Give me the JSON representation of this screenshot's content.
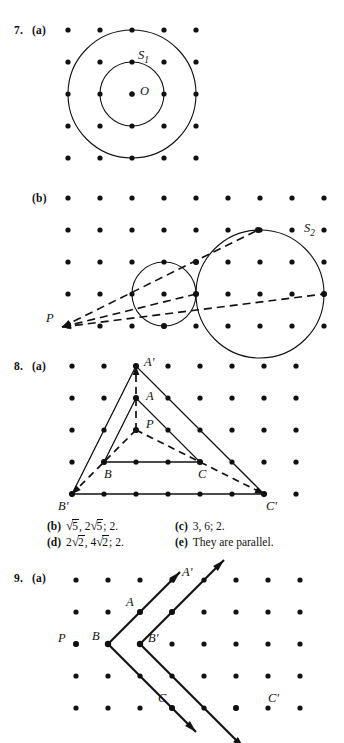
{
  "page": {
    "width": 344,
    "height": 743,
    "background": "#ffffff",
    "ink": "#111111"
  },
  "problems": [
    {
      "id": "problem-7a",
      "number": "7.",
      "part": "(a)",
      "figure": {
        "type": "lattice-circles",
        "lattice": {
          "cols": 5,
          "rows": 5,
          "spacing": 32,
          "origin_x": 68,
          "origin_y": 22,
          "dot_radius": 2.6
        },
        "circles": [
          {
            "name": "inner-circle",
            "label": "S_1",
            "cx": 132,
            "cy": 86,
            "r": 32
          },
          {
            "name": "outer-circle",
            "label": "",
            "cx": 132,
            "cy": 86,
            "r": 64
          }
        ],
        "labels": [
          {
            "name": "label-S1",
            "text": "S",
            "sub": "1",
            "x": 138,
            "y": 51,
            "style": "italic"
          },
          {
            "name": "label-O",
            "text": "O",
            "sub": "",
            "x": 140,
            "y": 87,
            "style": "italic"
          }
        ],
        "center_point": {
          "name": "center-O",
          "x": 132,
          "y": 86
        }
      }
    },
    {
      "id": "problem-7b",
      "number": "",
      "part": "(b)",
      "figure": {
        "type": "lattice-homothety-circles",
        "lattice": {
          "cols": 9,
          "rows": 5,
          "spacing": 32,
          "origin_x": 68,
          "origin_y": 12,
          "dot_radius": 2.6
        },
        "circles": [
          {
            "name": "small-circle",
            "label": "",
            "cx": 164,
            "cy": 108,
            "r": 32
          },
          {
            "name": "large-circle",
            "label": "S_2",
            "cx": 260,
            "cy": 108,
            "r": 64
          }
        ],
        "center_P": {
          "name": "point-P",
          "x": 62,
          "y": 141
        },
        "rays": [
          {
            "name": "tangent-ray-upper",
            "x1": 62,
            "y1": 141,
            "x2": 258,
            "y2": 44
          },
          {
            "name": "tangent-ray-lower",
            "x1": 62,
            "y1": 141,
            "x2": 324,
            "y2": 108
          },
          {
            "name": "tangent-ray-middle",
            "x1": 62,
            "y1": 141,
            "x2": 196,
            "y2": 108
          }
        ],
        "labels": [
          {
            "name": "label-P",
            "text": "P",
            "sub": "",
            "x": 46,
            "y": 136,
            "style": "italic"
          },
          {
            "name": "label-S2",
            "text": "S",
            "sub": "2",
            "x": 304,
            "y": 46,
            "style": "italic"
          }
        ]
      }
    },
    {
      "id": "problem-8a",
      "number": "8.",
      "part": "(a)",
      "figure": {
        "type": "lattice-homothety-triangles",
        "lattice": {
          "cols": 8,
          "rows": 5,
          "spacing": 32,
          "origin_x": 72,
          "origin_y": 8,
          "dot_radius": 2.6
        },
        "center_P": {
          "name": "point-P",
          "x": 136,
          "y": 72
        },
        "triangle_small": {
          "name": "triangle-ABC",
          "vertices": [
            {
              "label": "A",
              "x": 136,
              "y": 40
            },
            {
              "label": "B",
              "x": 104,
              "y": 104
            },
            {
              "label": "C",
              "x": 200,
              "y": 104
            }
          ]
        },
        "triangle_large": {
          "name": "triangle-A-prime-B-prime-C-prime",
          "vertices": [
            {
              "label": "A'",
              "x": 136,
              "y": 8
            },
            {
              "label": "B'",
              "x": 72,
              "y": 136
            },
            {
              "label": "C'",
              "x": 264,
              "y": 136
            }
          ]
        },
        "rays": [
          {
            "name": "ray-P-to-A-prime",
            "x1": 136,
            "y1": 72,
            "x2": 136,
            "y2": 8
          },
          {
            "name": "ray-P-to-B-prime",
            "x1": 136,
            "y1": 72,
            "x2": 72,
            "y2": 136
          },
          {
            "name": "ray-P-to-C-prime",
            "x1": 136,
            "y1": 72,
            "x2": 264,
            "y2": 136
          }
        ],
        "labels": [
          {
            "name": "label-A-prime",
            "text": "A'",
            "x": 144,
            "y": 8,
            "style": "italic"
          },
          {
            "name": "label-A",
            "text": "A",
            "x": 146,
            "y": 42,
            "style": "italic"
          },
          {
            "name": "label-P",
            "text": "P",
            "x": 146,
            "y": 70,
            "style": "italic"
          },
          {
            "name": "label-B",
            "text": "B",
            "x": 104,
            "y": 120,
            "style": "italic"
          },
          {
            "name": "label-C",
            "text": "C",
            "x": 198,
            "y": 120,
            "style": "italic"
          },
          {
            "name": "label-B-prime",
            "text": "B'",
            "x": 58,
            "y": 152,
            "style": "italic"
          },
          {
            "name": "label-C-prime",
            "text": "C'",
            "x": 266,
            "y": 152,
            "style": "italic"
          }
        ]
      }
    },
    {
      "id": "problem-9a",
      "number": "9.",
      "part": "(a)",
      "figure": {
        "type": "lattice-translated-angles",
        "lattice": {
          "cols": 8,
          "rows": 5,
          "spacing": 32,
          "origin_x": 76,
          "origin_y": 20,
          "dot_radius": 2.6
        },
        "point_P": {
          "name": "point-P",
          "x": 76,
          "y": 84
        },
        "angle_original": {
          "name": "angle-at-B",
          "vertex": {
            "label": "B",
            "x": 108,
            "y": 84
          },
          "ray_A": {
            "name": "ray-B-to-A",
            "x2": 180,
            "y2": 12,
            "through_label": "A",
            "through_x": 140,
            "through_y": 52
          },
          "ray_C": {
            "name": "ray-B-to-C",
            "x2": 196,
            "y2": 172,
            "through_label": "C",
            "through_x": 172,
            "through_y": 148
          }
        },
        "angle_image": {
          "name": "angle-at-B-prime",
          "vertex": {
            "label": "B'",
            "x": 140,
            "y": 84
          },
          "ray_A": {
            "name": "ray-B-prime-to-A-prime",
            "x2": 224,
            "y2": 0,
            "through_label": "A'",
            "through_x": 172,
            "through_y": 52
          },
          "ray_C": {
            "name": "ray-B-prime-to-C-prime",
            "x2": 244,
            "y2": 188,
            "through_label": "C'",
            "through_x": 236,
            "through_y": 148
          }
        },
        "labels": [
          {
            "name": "label-P",
            "text": "P",
            "x": 58,
            "y": 82,
            "style": "italic"
          },
          {
            "name": "label-B",
            "text": "B",
            "x": 92,
            "y": 80,
            "style": "italic"
          },
          {
            "name": "label-B-prime",
            "text": "B'",
            "x": 148,
            "y": 82,
            "style": "italic"
          },
          {
            "name": "label-A",
            "text": "A",
            "x": 126,
            "y": 46,
            "style": "italic"
          },
          {
            "name": "label-A-prime",
            "text": "A'",
            "x": 182,
            "y": 16,
            "style": "italic"
          },
          {
            "name": "label-C",
            "text": "C",
            "x": 158,
            "y": 142,
            "style": "italic"
          },
          {
            "name": "label-C-prime",
            "text": "C'",
            "x": 268,
            "y": 142,
            "style": "italic"
          }
        ]
      }
    }
  ],
  "answers": {
    "name": "answer-list",
    "rows": [
      [
        {
          "tag": "(b)",
          "parts": [
            {
              "kind": "sqrt",
              "pre": "",
              "under": "5"
            },
            {
              "kind": "text",
              "value": ", "
            },
            {
              "kind": "sqrt",
              "pre": "2",
              "under": "5"
            },
            {
              "kind": "text",
              "value": "; 2."
            }
          ]
        },
        {
          "tag": "(c)",
          "parts": [
            {
              "kind": "text",
              "value": "3, 6; 2."
            }
          ]
        }
      ],
      [
        {
          "tag": "(d)",
          "parts": [
            {
              "kind": "sqrt",
              "pre": "2",
              "under": "2"
            },
            {
              "kind": "text",
              "value": ", "
            },
            {
              "kind": "sqrt",
              "pre": "4",
              "under": "2"
            },
            {
              "kind": "text",
              "value": "; 2."
            }
          ]
        },
        {
          "tag": "(e)",
          "parts": [
            {
              "kind": "text",
              "value": "They are parallel."
            }
          ]
        }
      ]
    ]
  }
}
